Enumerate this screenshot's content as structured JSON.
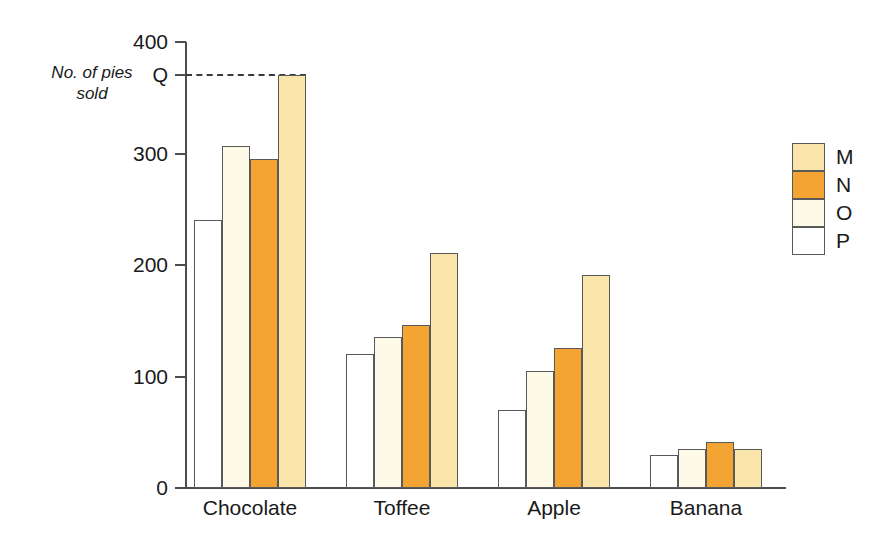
{
  "chart_data": {
    "type": "bar",
    "title": "",
    "subtitle": "",
    "xlabel": "",
    "ylabel": "No. of pies\nsold",
    "categories": [
      "Chocolate",
      "Toffee",
      "Apple",
      "Banana"
    ],
    "series": [
      {
        "name": "P",
        "color": "#ffffff",
        "values": [
          240,
          120,
          70,
          30
        ]
      },
      {
        "name": "O",
        "color": "#fdfbe8",
        "values": [
          307,
          135,
          105,
          35
        ]
      },
      {
        "name": "N",
        "color": "#f4a433",
        "values": [
          295,
          146,
          126,
          41
        ]
      },
      {
        "name": "M",
        "color": "#fae6ab",
        "values": [
          370,
          211,
          191,
          35
        ]
      }
    ],
    "ylim": [
      0,
      400
    ],
    "yticks": [
      0,
      100,
      200,
      300,
      400
    ],
    "ytick_labels": [
      "0",
      "100",
      "200",
      "300",
      "400"
    ],
    "grid": false,
    "legend_position": "right",
    "legend_order": [
      "M",
      "N",
      "O",
      "P"
    ],
    "annotations": [
      {
        "name": "Q",
        "label": "Q",
        "value": 370,
        "style": "dashed-line",
        "note": "Dashed guide line from y-axis at Q to top of Chocolate M bar"
      }
    ]
  },
  "legend": {
    "items": [
      {
        "label": "M",
        "color": "#fae6ab"
      },
      {
        "label": "N",
        "color": "#f4a433"
      },
      {
        "label": "O",
        "color": "#fdfbe8"
      },
      {
        "label": "P",
        "color": "#ffffff"
      }
    ]
  }
}
